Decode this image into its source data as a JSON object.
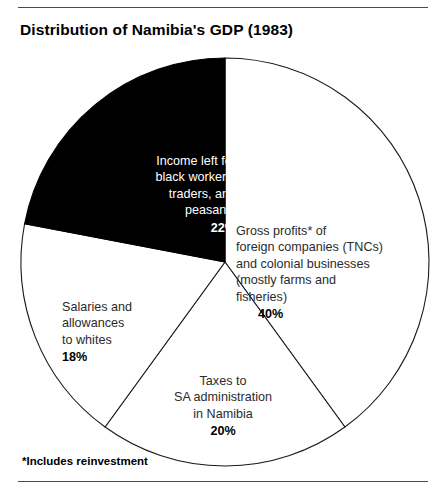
{
  "chart_data": {
    "type": "pie",
    "title": "Distribution of Namibia's GDP (1983)",
    "footnote": "*Includes reinvestment",
    "start_angle_deg": 0,
    "direction": "clockwise",
    "legend": "none (labels placed in/around slices)",
    "center": {
      "cx": 225,
      "cy": 262,
      "r": 204
    },
    "slices": [
      {
        "name": "gross-profits",
        "label": "Gross profits* of\nforeign companies (TNCs)\nand colonial businesses\n(mostly farms and\nfisheries)",
        "value": 40,
        "percent_text": "40%",
        "fill": "#ffffff",
        "stroke": "#1a1a1a",
        "text_color": "#2b2b2b",
        "start_deg": 0,
        "end_deg": 144
      },
      {
        "name": "taxes",
        "label": "Taxes to\nSA administration\nin Namibia",
        "value": 20,
        "percent_text": "20%",
        "fill": "#ffffff",
        "stroke": "#1a1a1a",
        "text_color": "#2b2b2b",
        "start_deg": 144,
        "end_deg": 216
      },
      {
        "name": "salaries",
        "label": "Salaries and\nallowances\nto whites",
        "value": 18,
        "percent_text": "18%",
        "fill": "#ffffff",
        "stroke": "#1a1a1a",
        "text_color": "#2b2b2b",
        "start_deg": 216,
        "end_deg": 280.8
      },
      {
        "name": "income-left",
        "label": "Income left for\nblack workers,\ntraders, and\npeasants",
        "value": 22,
        "percent_text": "22%",
        "fill": "#000000",
        "stroke": "#000000",
        "text_color": "#ffffff",
        "start_deg": 280.8,
        "end_deg": 360
      }
    ],
    "total": 100,
    "units": "percent of GDP"
  },
  "figure": {
    "title": "Distribution of Namibia's GDP (1983)",
    "footnote": "*Includes reinvestment",
    "colors": {
      "ink": "#000000",
      "rule": "#4a4a4a",
      "outline": "#1a1a1a",
      "highlight_fill": "#000000",
      "highlight_text": "#ffffff",
      "body_text": "#2b2b2b",
      "background": "#ffffff"
    }
  }
}
